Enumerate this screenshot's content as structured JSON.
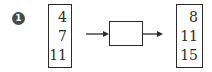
{
  "diagram": {
    "marker_label": "1",
    "input_values": [
      "4",
      "7",
      "11"
    ],
    "function_box_label": "",
    "output_values": [
      "8",
      "11",
      "15"
    ],
    "colors": {
      "stroke": "#2b2b2b",
      "marker_fill": "#4a4a4a"
    }
  }
}
